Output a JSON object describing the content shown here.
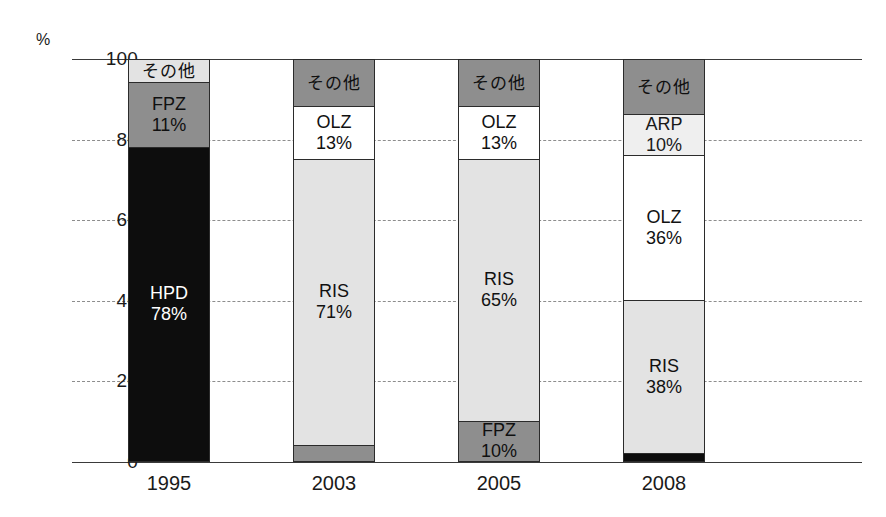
{
  "axis": {
    "unit_label": "%",
    "y_ticks": [
      100,
      80,
      60,
      40,
      20,
      0
    ],
    "y_tick_labels": [
      "100",
      "80",
      "60",
      "40",
      "20",
      "0"
    ]
  },
  "bottom_caption": {
    "text": ""
  },
  "chart_data": {
    "type": "bar",
    "subtype": "stacked-100",
    "title": "",
    "xlabel": "",
    "ylabel": "%",
    "ylim": [
      0,
      100
    ],
    "grid": true,
    "grid_lines": [
      0,
      20,
      40,
      60,
      80,
      100
    ],
    "legend": "none",
    "categories": [
      "1995",
      "2003",
      "2005",
      "2008"
    ],
    "series": [
      {
        "name": "HPD",
        "label": "HPD",
        "color": "#0d0d0d",
        "values": [
          78,
          0,
          0,
          2
        ],
        "value_labels": [
          "78%",
          "",
          "",
          ""
        ]
      },
      {
        "name": "FPZ",
        "label": "FPZ",
        "color": "#7d7d7d",
        "values": [
          11,
          4,
          10,
          0
        ],
        "value_labels": [
          "11%",
          "",
          "10%",
          ""
        ]
      },
      {
        "name": "RIS",
        "label": "RIS",
        "color": "#e2e2e2",
        "values": [
          0,
          71,
          65,
          38
        ],
        "value_labels": [
          "",
          "71%",
          "65%",
          "38%"
        ]
      },
      {
        "name": "OLZ",
        "label": "OLZ",
        "color": "#ffffff",
        "values": [
          0,
          13,
          13,
          36
        ],
        "value_labels": [
          "",
          "13%",
          "13%",
          "36%"
        ]
      },
      {
        "name": "ARP",
        "label": "ARP",
        "color": "#eeeeee",
        "values": [
          0,
          0,
          0,
          10
        ],
        "value_labels": [
          "",
          "",
          "",
          "10%"
        ]
      },
      {
        "name": "その他",
        "label": "その他",
        "color": "#a8a8a8",
        "values": [
          11,
          12,
          12,
          14
        ],
        "value_labels": [
          "",
          "",
          "",
          ""
        ]
      }
    ]
  },
  "bars": [
    {
      "year": "1995",
      "segments": [
        {
          "label": "その他",
          "value_label": "",
          "pct": 6,
          "tone": "light"
        },
        {
          "label": "FPZ",
          "value_label": "11%",
          "pct": 16,
          "tone": "mid"
        },
        {
          "label": "HPD",
          "value_label": "78%",
          "pct": 78,
          "tone": "dark"
        }
      ]
    },
    {
      "year": "2003",
      "segments": [
        {
          "label": "その他",
          "value_label": "",
          "pct": 12,
          "tone": "mid"
        },
        {
          "label": "OLZ",
          "value_label": "13%",
          "pct": 13,
          "tone": "white"
        },
        {
          "label": "RIS",
          "value_label": "71%",
          "pct": 71,
          "tone": "light"
        },
        {
          "label": "",
          "value_label": "",
          "pct": 4,
          "tone": "mid"
        }
      ]
    },
    {
      "year": "2005",
      "segments": [
        {
          "label": "その他",
          "value_label": "",
          "pct": 12,
          "tone": "mid"
        },
        {
          "label": "OLZ",
          "value_label": "13%",
          "pct": 13,
          "tone": "white"
        },
        {
          "label": "RIS",
          "value_label": "65%",
          "pct": 65,
          "tone": "light"
        },
        {
          "label": "FPZ",
          "value_label": "10%",
          "pct": 10,
          "tone": "mid"
        }
      ]
    },
    {
      "year": "2008",
      "segments": [
        {
          "label": "その他",
          "value_label": "",
          "pct": 14,
          "tone": "mid"
        },
        {
          "label": "ARP",
          "value_label": "10%",
          "pct": 10,
          "tone": "lighter"
        },
        {
          "label": "OLZ",
          "value_label": "36%",
          "pct": 36,
          "tone": "white"
        },
        {
          "label": "RIS",
          "value_label": "38%",
          "pct": 38,
          "tone": "light"
        },
        {
          "label": "",
          "value_label": "",
          "pct": 2,
          "tone": "black"
        }
      ]
    }
  ],
  "bar_left_positions": [
    56,
    221,
    386,
    551
  ]
}
